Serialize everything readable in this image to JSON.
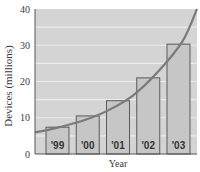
{
  "chart_data": {
    "type": "bar",
    "title": "",
    "xlabel": "Year",
    "ylabel": "Devices (millions)",
    "categories": [
      "'99",
      "'00",
      "'01",
      "'02",
      "'03"
    ],
    "values": [
      7.4,
      10.5,
      14.7,
      21,
      30.3
    ],
    "ylim": [
      0,
      40
    ],
    "yticks": [
      0,
      10,
      20,
      30,
      40
    ],
    "grid": true,
    "grid_step": 5,
    "legend": null,
    "overlay_curve": {
      "type": "exponential trend line",
      "points": [
        [
          0,
          6.0
        ],
        [
          0.5,
          6.6
        ],
        [
          1,
          7.4
        ],
        [
          2,
          9.3
        ],
        [
          3,
          12.1
        ],
        [
          4,
          16.2
        ],
        [
          5,
          22.6
        ],
        [
          6,
          31.0
        ],
        [
          6.6,
          40
        ]
      ]
    }
  },
  "colors": {
    "plot_background": "#d4d4d4",
    "gridline": "#ececec",
    "bar_fill": "#c6c6c6",
    "bar_stroke": "#5a5a5a",
    "curve": "#7a7a7a",
    "axis": "#555555"
  }
}
